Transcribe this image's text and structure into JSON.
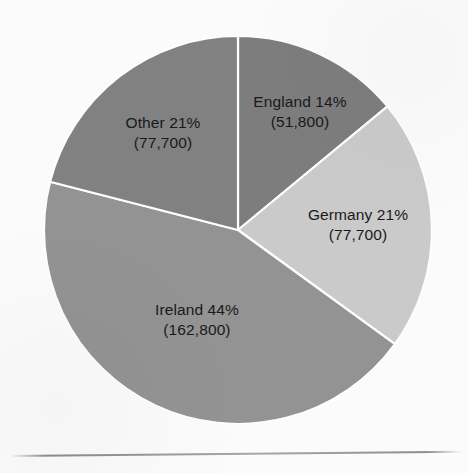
{
  "background_color": "#fbfbfb",
  "chart_data": {
    "type": "pie",
    "title": "",
    "subtitle": "",
    "xlabel": "",
    "ylabel": "",
    "legend_position": "none",
    "grid": false,
    "labels_inside_slices": true,
    "start_angle_deg": 0,
    "direction": "clockwise",
    "categories": [
      "England",
      "Germany",
      "Ireland",
      "Other"
    ],
    "values": [
      51800,
      77700,
      162800,
      77700
    ],
    "percentages": [
      14,
      21,
      44,
      21
    ],
    "colors": [
      "#7d7d7d",
      "#cacaca",
      "#939393",
      "#818181"
    ],
    "slices": [
      {
        "name": "England",
        "percent": 14,
        "value": 51800,
        "percent_text": "England 14%",
        "value_text": "(51,800)",
        "color": "#7d7d7d"
      },
      {
        "name": "Germany",
        "percent": 21,
        "value": 77700,
        "percent_text": "Germany 21%",
        "value_text": "(77,700)",
        "color": "#cacaca"
      },
      {
        "name": "Ireland",
        "percent": 44,
        "value": 162800,
        "percent_text": "Ireland 44%",
        "value_text": "(162,800)",
        "color": "#939393"
      },
      {
        "name": "Other",
        "percent": 21,
        "value": 77700,
        "percent_text": "Other 21%",
        "value_text": "(77,700)",
        "color": "#818181"
      }
    ],
    "geometry": {
      "center_x": 238,
      "center_y": 230,
      "radius": 194
    }
  }
}
